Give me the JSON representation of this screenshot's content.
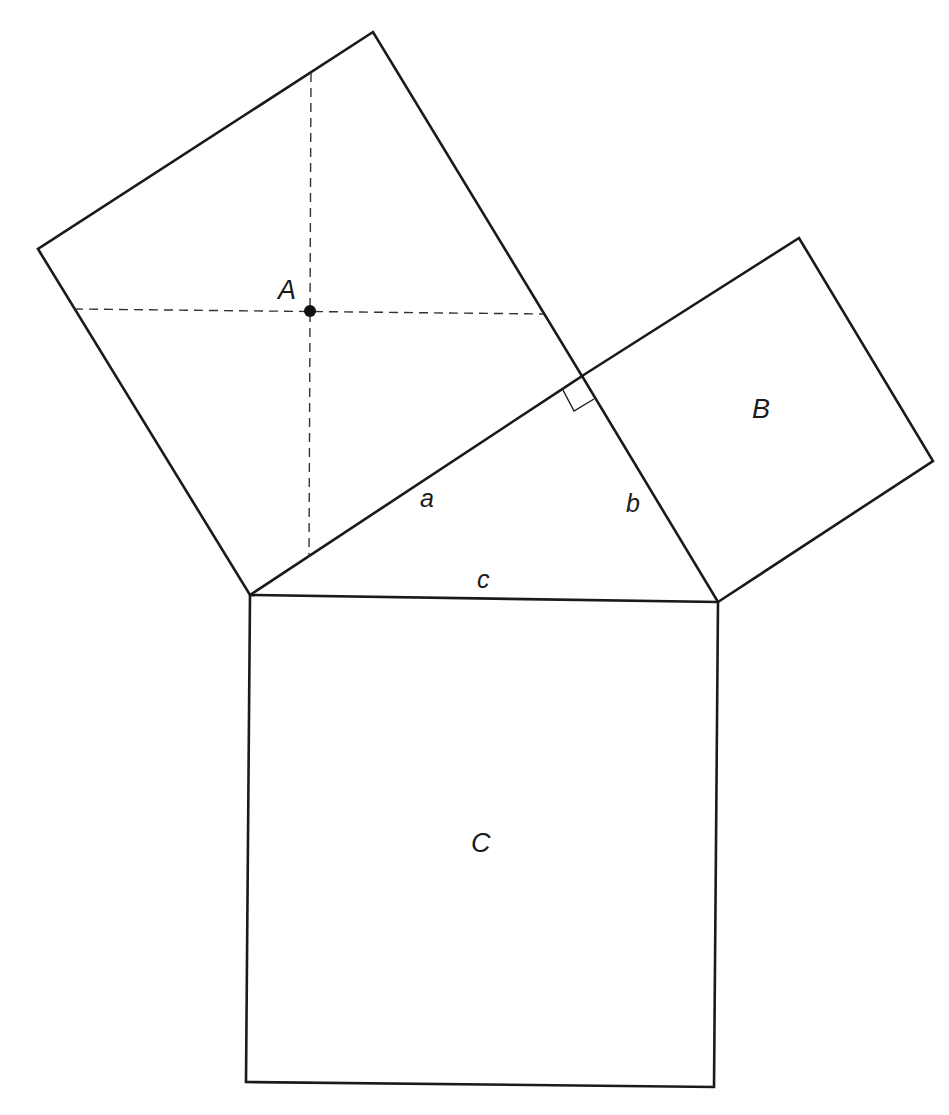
{
  "figure": {
    "title": "",
    "colors": {
      "stroke": "#1a1a1a",
      "background": "#ffffff"
    }
  },
  "labels": {
    "square_a": "A",
    "square_b": "B",
    "square_c": "C",
    "side_a": "a",
    "side_b": "b",
    "side_c": "c"
  },
  "geometry": {
    "square_a": [
      [
        373,
        32
      ],
      [
        38,
        249
      ],
      [
        250,
        595
      ],
      [
        582,
        376
      ]
    ],
    "square_b": [
      [
        582,
        376
      ],
      [
        799,
        238
      ],
      [
        933,
        461
      ],
      [
        718,
        602
      ]
    ],
    "square_c": [
      [
        250,
        595
      ],
      [
        718,
        602
      ],
      [
        714,
        1087
      ],
      [
        246,
        1082
      ]
    ],
    "triangle": [
      [
        250,
        595
      ],
      [
        582,
        376
      ],
      [
        718,
        602
      ]
    ],
    "center_point_a": [
      311,
      311
    ],
    "dashed_vertical": [
      [
        311,
        73
      ],
      [
        309,
        557
      ]
    ],
    "dashed_horizontal": [
      [
        74,
        309
      ],
      [
        543,
        314
      ]
    ],
    "right_angle_marker": [
      [
        563,
        390
      ],
      [
        574,
        411
      ],
      [
        594,
        399
      ]
    ]
  }
}
